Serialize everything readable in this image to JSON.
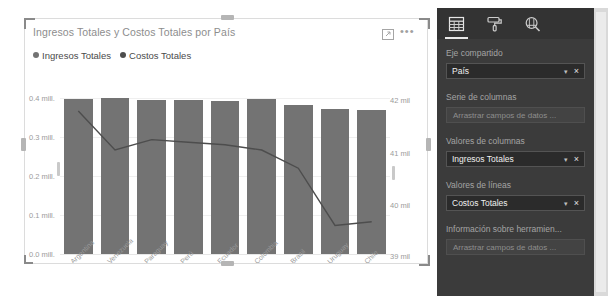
{
  "visual": {
    "title": "Ingresos Totales y Costos Totales por País",
    "focus_icon": "focus-mode-icon",
    "more_icon": "•••",
    "legend": [
      {
        "label": "Ingresos Totales",
        "color": "#737373",
        "marker": "circle"
      },
      {
        "label": "Costos Totales",
        "color": "#4d4d4d",
        "marker": "circle"
      }
    ]
  },
  "chart_data": {
    "type": "bar",
    "combo": "line-and-clustered-column",
    "title": "Ingresos Totales y Costos Totales por País",
    "xlabel": "",
    "ylabel": "",
    "grid": true,
    "legend_position": "top-left",
    "categories": [
      "Argentina",
      "Venezuela",
      "Paraguay",
      "Perú",
      "Ecuador",
      "Colombia",
      "Brasil",
      "Uruguay",
      "Chile"
    ],
    "series": [
      {
        "name": "Ingresos Totales",
        "type": "bar",
        "axis": "left",
        "color": "#737373",
        "values": [
          0.398,
          0.4,
          0.394,
          0.394,
          0.392,
          0.398,
          0.382,
          0.372,
          0.37
        ]
      },
      {
        "name": "Costos Totales",
        "type": "line",
        "axis": "right",
        "color": "#4d4d4d",
        "values": [
          41.75,
          41.0,
          41.2,
          41.15,
          41.1,
          41.0,
          40.65,
          39.55,
          39.62
        ]
      }
    ],
    "yaxis_left": {
      "ticks": [
        "0.0 mill.",
        "0.1 mill.",
        "0.2 mill.",
        "0.3 mill.",
        "0.4 mill."
      ],
      "ylim": [
        0,
        0.4
      ],
      "unit": "mill."
    },
    "yaxis_right": {
      "ticks": [
        "39 mil",
        "40 mil",
        "41 mil",
        "42 mil"
      ],
      "ylim": [
        39,
        42
      ],
      "unit": "mil"
    }
  },
  "pane": {
    "tabs": [
      {
        "name": "fields-tab",
        "icon": "table-fields-icon",
        "active": true
      },
      {
        "name": "format-tab",
        "icon": "paint-roller-icon",
        "active": false
      },
      {
        "name": "analytics-tab",
        "icon": "magnifier-analytics-icon",
        "active": false
      }
    ],
    "sections": [
      {
        "heading": "Eje compartido",
        "kind": "chip",
        "value": "País",
        "caret": "▾",
        "close": "×"
      },
      {
        "heading": "Serie de columnas",
        "kind": "empty",
        "placeholder": "Arrastrar campos de datos ..."
      },
      {
        "heading": "Valores de columnas",
        "kind": "chip",
        "value": "Ingresos Totales",
        "caret": "▾",
        "close": "×"
      },
      {
        "heading": "Valores de líneas",
        "kind": "chip",
        "value": "Costos Totales",
        "caret": "▾",
        "close": "×"
      },
      {
        "heading": "Información sobre herramien...",
        "kind": "empty",
        "placeholder": "Arrastrar campos de datos ..."
      }
    ]
  },
  "colors": {
    "bar": "#737373",
    "line": "#4d4d4d",
    "pane_bg": "#3b3b3b",
    "pane_tabs_bg": "#333333",
    "chip_bg": "#2b2b2b"
  }
}
